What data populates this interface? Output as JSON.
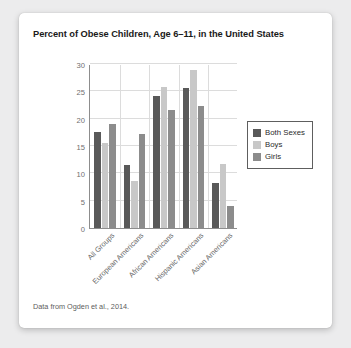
{
  "card": {
    "source_note": "Data from Ogden et al., 2014."
  },
  "chart_data": {
    "type": "bar",
    "title": "Percent of Obese Children, Age 6–11, in the United States",
    "xlabel": "",
    "ylabel": "",
    "ylim": [
      0,
      30
    ],
    "yticks": [
      0,
      5,
      10,
      15,
      20,
      25,
      30
    ],
    "grid": true,
    "legend_position": "right",
    "categories": [
      "All Groups",
      "European Americans",
      "African Americans",
      "Hispanic Americans",
      "Asian Americans"
    ],
    "series": [
      {
        "name": "Both Sexes",
        "color": "#595959",
        "values": [
          17.5,
          11.6,
          24.1,
          25.6,
          8.3
        ]
      },
      {
        "name": "Boys",
        "color": "#c8c8c8",
        "values": [
          15.6,
          8.6,
          25.8,
          28.9,
          11.7
        ]
      },
      {
        "name": "Girls",
        "color": "#8c8c8c",
        "values": [
          19.0,
          17.2,
          21.5,
          22.4,
          4.1
        ]
      }
    ]
  }
}
